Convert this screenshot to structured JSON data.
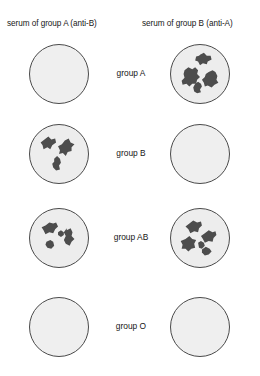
{
  "figure": {
    "background_color": "#ffffff",
    "well_fill_color": "#ededed",
    "well_border_color": "#4a4a4a",
    "clump_color": "#4d4d4d"
  },
  "columns": [
    {
      "id": "serum-a",
      "label": "serum of group A (anti-B)"
    },
    {
      "id": "serum-b",
      "label": "serum of group B (anti-A)"
    }
  ],
  "rows": [
    {
      "id": "group-a",
      "label": "group A",
      "left": {
        "agglutination": false,
        "clump_count": 0
      },
      "right": {
        "agglutination": true,
        "clump_count": 4
      }
    },
    {
      "id": "group-b",
      "label": "group B",
      "left": {
        "agglutination": true,
        "clump_count": 3
      },
      "right": {
        "agglutination": false,
        "clump_count": 0
      }
    },
    {
      "id": "group-ab",
      "label": "group AB",
      "left": {
        "agglutination": true,
        "clump_count": 4
      },
      "right": {
        "agglutination": true,
        "clump_count": 5
      }
    },
    {
      "id": "group-o",
      "label": "group O",
      "left": {
        "agglutination": false,
        "clump_count": 0
      },
      "right": {
        "agglutination": false,
        "clump_count": 0
      }
    }
  ]
}
